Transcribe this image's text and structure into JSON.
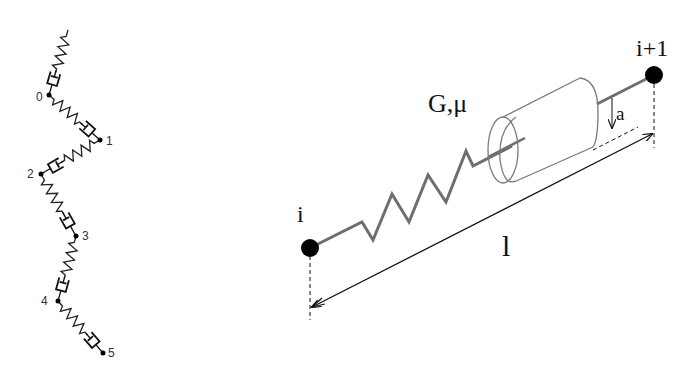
{
  "figure": {
    "left_panel": {
      "description": "Chain of spring-dashpot elements connecting nodes",
      "node_labels": [
        "0",
        "1",
        "2",
        "3",
        "4",
        "5"
      ]
    },
    "right_panel": {
      "description": "Single element between node i and node i+1: spring with cylinder (dashpot) of radius a, length l",
      "node_start_label": "i",
      "node_end_label": "i+1",
      "material_label": "G,μ",
      "radius_label": "a",
      "length_label": "l"
    },
    "colors": {
      "spring_right": "#6e6e6e",
      "node_fill": "#000000",
      "line_dark": "#111111",
      "cylinder": "#7a7a7a"
    }
  }
}
